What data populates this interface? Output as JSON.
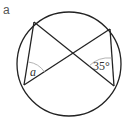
{
  "part_label": "a",
  "diagram": {
    "circle": {
      "cx": 69,
      "cy": 64,
      "r": 52
    },
    "points": {
      "top_left": [
        34,
        22
      ],
      "bottom_left": [
        24,
        85
      ],
      "top_right": [
        110,
        29
      ],
      "bottom_right": [
        114,
        86
      ]
    },
    "angles": [
      {
        "vertex": "bottom_left",
        "label": "a",
        "italic": true
      },
      {
        "vertex": "bottom_right",
        "label": "35°",
        "italic": false
      }
    ],
    "colors": {
      "stroke": "#222222",
      "arc": "#aaaaaa",
      "text": "#333333"
    }
  }
}
